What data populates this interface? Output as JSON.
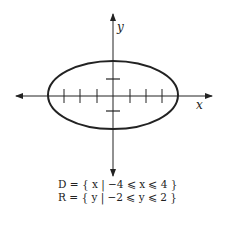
{
  "figure": {
    "type": "ellipse-graph",
    "axis_labels": {
      "x": "x",
      "y": "y"
    },
    "ellipse": {
      "center": [
        0,
        0
      ],
      "semi_x": 4,
      "semi_y": 2
    },
    "x_ticks": [
      -3,
      -2,
      -1,
      1,
      2,
      3
    ],
    "y_ticks": [
      -1,
      1
    ]
  },
  "domain_text": "D = { x | −4 ⩽ x ⩽ 4 }",
  "range_text": "R = { y | −2 ⩽ y ⩽ 2 }",
  "colors": {
    "stroke": "#222222",
    "background": "#ffffff"
  }
}
